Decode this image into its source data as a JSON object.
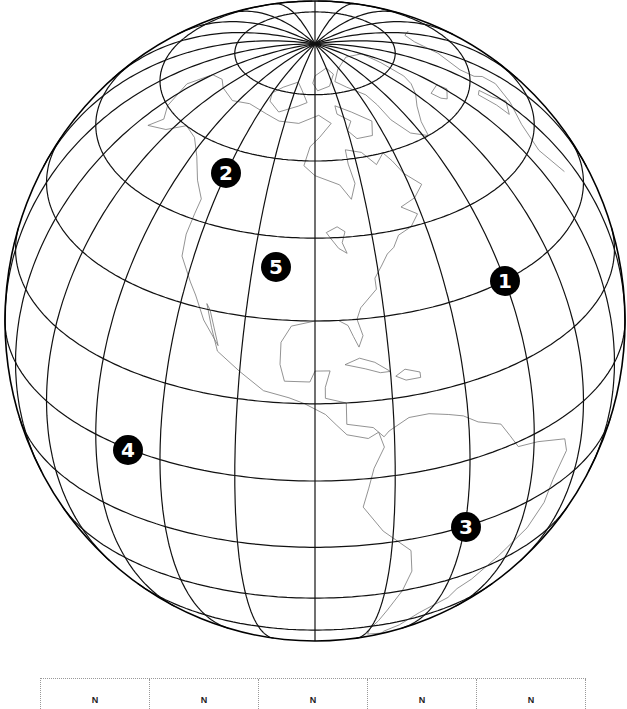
{
  "map": {
    "projection": "orthographic",
    "center": {
      "lat": 30,
      "lon": -90
    },
    "screen": {
      "cx": 315,
      "cy": 321,
      "rx": 310,
      "ry": 320
    },
    "graticule_step_deg": 15,
    "colors": {
      "graticule": "#111111",
      "coast": "#777777",
      "outline": "#000000",
      "marker_bg": "#000000",
      "marker_fg": "#ffffff"
    }
  },
  "markers": [
    {
      "label": "1",
      "x": 505,
      "y": 281
    },
    {
      "label": "2",
      "x": 226,
      "y": 173
    },
    {
      "label": "3",
      "x": 466,
      "y": 527
    },
    {
      "label": "4",
      "x": 128,
      "y": 450
    },
    {
      "label": "5",
      "x": 276,
      "y": 267
    }
  ],
  "answer_table": {
    "cells": [
      "N",
      "N",
      "N",
      "N",
      "N"
    ]
  },
  "coastlines": [
    [
      [
        70,
        -165
      ],
      [
        65,
        -168
      ],
      [
        60,
        -162
      ],
      [
        58,
        -157
      ],
      [
        55,
        -160
      ],
      [
        57,
        -152
      ],
      [
        60,
        -146
      ],
      [
        59,
        -139
      ],
      [
        56,
        -133
      ],
      [
        52,
        -128
      ],
      [
        49,
        -124
      ],
      [
        46,
        -124
      ],
      [
        42,
        -124
      ],
      [
        38,
        -123
      ],
      [
        34,
        -119
      ],
      [
        32,
        -117
      ],
      [
        28,
        -114
      ],
      [
        24,
        -110
      ],
      [
        30,
        -113
      ],
      [
        31,
        -114
      ],
      [
        27,
        -112
      ],
      [
        23,
        -110
      ],
      [
        20,
        -105
      ],
      [
        17,
        -100
      ],
      [
        16,
        -95
      ],
      [
        15,
        -92
      ],
      [
        13,
        -88
      ],
      [
        11,
        -86
      ],
      [
        9,
        -84
      ],
      [
        8,
        -80
      ],
      [
        9,
        -78
      ],
      [
        6,
        -77
      ],
      [
        2,
        -79
      ],
      [
        -2,
        -80
      ],
      [
        -6,
        -81
      ],
      [
        -12,
        -77
      ],
      [
        -18,
        -71
      ],
      [
        -24,
        -70
      ],
      [
        -30,
        -71
      ],
      [
        -37,
        -73
      ],
      [
        -42,
        -74
      ],
      [
        -47,
        -75
      ],
      [
        -52,
        -74
      ],
      [
        -55,
        -68
      ],
      [
        -52,
        -69
      ],
      [
        -48,
        -66
      ],
      [
        -42,
        -63
      ],
      [
        -38,
        -57
      ],
      [
        -35,
        -56
      ],
      [
        -33,
        -53
      ],
      [
        -28,
        -48
      ],
      [
        -23,
        -42
      ],
      [
        -18,
        -39
      ],
      [
        -13,
        -38
      ],
      [
        -8,
        -35
      ],
      [
        -5,
        -36
      ],
      [
        -2,
        -44
      ],
      [
        -1,
        -49
      ],
      [
        2,
        -51
      ],
      [
        5,
        -53
      ],
      [
        7,
        -58
      ],
      [
        9,
        -61
      ],
      [
        10,
        -64
      ],
      [
        11,
        -68
      ],
      [
        11,
        -72
      ],
      [
        9,
        -76
      ],
      [
        8,
        -77
      ],
      [
        10,
        -79
      ],
      [
        11,
        -84
      ],
      [
        15,
        -84
      ],
      [
        16,
        -88
      ],
      [
        18,
        -88
      ],
      [
        21,
        -87
      ],
      [
        21,
        -90
      ],
      [
        19,
        -91
      ],
      [
        19,
        -96
      ],
      [
        22,
        -97
      ],
      [
        26,
        -97
      ],
      [
        29,
        -95
      ],
      [
        30,
        -90
      ],
      [
        30,
        -85
      ],
      [
        29,
        -83
      ],
      [
        27,
        -82
      ],
      [
        25,
        -81
      ],
      [
        27,
        -80
      ],
      [
        30,
        -81
      ],
      [
        32,
        -80
      ],
      [
        35,
        -76
      ],
      [
        37,
        -76
      ],
      [
        39,
        -74
      ],
      [
        41,
        -72
      ],
      [
        42,
        -70
      ],
      [
        44,
        -68
      ],
      [
        45,
        -64
      ],
      [
        47,
        -61
      ],
      [
        49,
        -65
      ],
      [
        50,
        -60
      ],
      [
        52,
        -56
      ],
      [
        55,
        -60
      ],
      [
        58,
        -62
      ],
      [
        60,
        -64
      ],
      [
        58,
        -68
      ],
      [
        61,
        -72
      ],
      [
        62,
        -78
      ],
      [
        59,
        -78
      ],
      [
        55,
        -77
      ],
      [
        52,
        -79
      ],
      [
        55,
        -82
      ],
      [
        57,
        -90
      ],
      [
        59,
        -94
      ],
      [
        63,
        -92
      ],
      [
        65,
        -88
      ],
      [
        68,
        -82
      ],
      [
        70,
        -88
      ],
      [
        68,
        -98
      ],
      [
        68,
        -108
      ],
      [
        69,
        -116
      ],
      [
        70,
        -128
      ],
      [
        69,
        -138
      ],
      [
        70,
        -150
      ],
      [
        71,
        -157
      ],
      [
        70,
        -165
      ]
    ],
    [
      [
        60,
        -43
      ],
      [
        62,
        -49
      ],
      [
        66,
        -53
      ],
      [
        70,
        -54
      ],
      [
        73,
        -56
      ],
      [
        76,
        -65
      ],
      [
        78,
        -72
      ],
      [
        81,
        -62
      ],
      [
        83,
        -35
      ],
      [
        81,
        -15
      ],
      [
        77,
        -19
      ],
      [
        72,
        -22
      ],
      [
        70,
        -25
      ],
      [
        68,
        -30
      ],
      [
        66,
        -36
      ],
      [
        63,
        -41
      ],
      [
        60,
        -43
      ]
    ],
    [
      [
        22,
        -84
      ],
      [
        23,
        -81
      ],
      [
        22,
        -78
      ],
      [
        20,
        -75
      ],
      [
        20,
        -77
      ],
      [
        21,
        -80
      ],
      [
        22,
        -84
      ]
    ],
    [
      [
        19,
        -74
      ],
      [
        20,
        -72
      ],
      [
        19,
        -69
      ],
      [
        18,
        -69
      ],
      [
        18,
        -72
      ],
      [
        19,
        -74
      ]
    ],
    [
      [
        46,
        -87
      ],
      [
        47,
        -84
      ],
      [
        46,
        -82
      ],
      [
        44,
        -83
      ],
      [
        42,
        -82
      ],
      [
        43,
        -84
      ],
      [
        45,
        -86
      ],
      [
        46,
        -87
      ]
    ],
    [
      [
        36,
        -6
      ],
      [
        43,
        -9
      ],
      [
        48,
        -5
      ],
      [
        51,
        2
      ],
      [
        54,
        8
      ],
      [
        57,
        8
      ],
      [
        59,
        5
      ],
      [
        62,
        5
      ],
      [
        66,
        13
      ],
      [
        70,
        20
      ],
      [
        71,
        27
      ],
      [
        69,
        33
      ]
    ],
    [
      [
        58,
        -6
      ],
      [
        58,
        -3
      ],
      [
        55,
        -2
      ],
      [
        52,
        1
      ],
      [
        51,
        -5
      ],
      [
        54,
        -5
      ],
      [
        58,
        -6
      ]
    ],
    [
      [
        64,
        -22
      ],
      [
        66,
        -23
      ],
      [
        66,
        -15
      ],
      [
        64,
        -14
      ],
      [
        63,
        -20
      ],
      [
        64,
        -22
      ]
    ],
    [
      [
        73,
        -95
      ],
      [
        76,
        -100
      ],
      [
        78,
        -105
      ],
      [
        76,
        -115
      ],
      [
        74,
        -120
      ],
      [
        72,
        -118
      ],
      [
        70,
        -110
      ],
      [
        72,
        -100
      ],
      [
        73,
        -95
      ]
    ],
    [
      [
        80,
        -90
      ],
      [
        82,
        -75
      ],
      [
        80,
        -70
      ],
      [
        77,
        -78
      ],
      [
        76,
        -88
      ],
      [
        78,
        -92
      ],
      [
        80,
        -90
      ]
    ],
    [
      [
        72,
        -78
      ],
      [
        70,
        -70
      ],
      [
        67,
        -62
      ],
      [
        64,
        -65
      ],
      [
        64,
        -72
      ],
      [
        66,
        -75
      ],
      [
        68,
        -72
      ],
      [
        70,
        -78
      ],
      [
        72,
        -78
      ]
    ]
  ]
}
